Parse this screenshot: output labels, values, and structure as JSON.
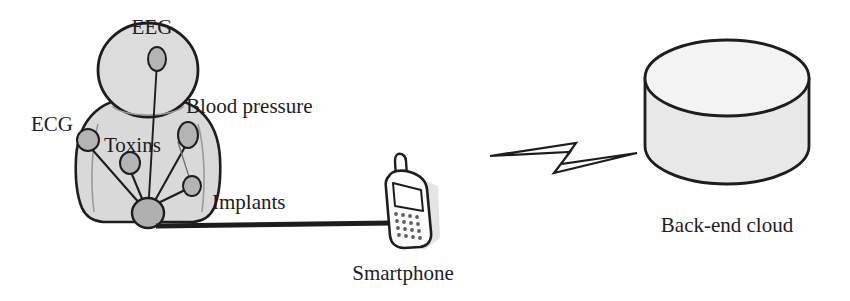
{
  "figure": {
    "background_color": "#ffffff",
    "ink_color": "#1d1d1d"
  },
  "colors": {
    "body_fill": "#d9d9d9",
    "head_fill": "#dcdcdc",
    "sensor_fill": "#b4b4b4",
    "hub_fill": "#b0b0b0",
    "cylinder_fill": "#f2f2f2",
    "cylinder_side_fill": "#e6e6e6",
    "phone_fill": "#fbfbfb",
    "phone_screen_fill": "#ffffff",
    "outline": "#1d1d1d",
    "shadow": "#e2e2e2",
    "link_line": "#2a2a2a"
  },
  "nodes": {
    "body": {
      "name": "human-body-silhouette",
      "label": "Body"
    },
    "sensors": [
      {
        "id": "eeg",
        "label": "EEG",
        "label_x": 152,
        "label_y": 34,
        "label_anchor": "middle",
        "font_size": 21,
        "cx": 157,
        "cy": 59,
        "rx": 9,
        "ry": 12
      },
      {
        "id": "ecg",
        "label": "ECG",
        "label_x": 31,
        "label_y": 131,
        "label_anchor": "start",
        "font_size": 21,
        "cx": 88,
        "cy": 140,
        "rx": 11,
        "ry": 11
      },
      {
        "id": "blood-pressure",
        "label": "Blood pressure",
        "label_x": 186,
        "label_y": 113,
        "label_anchor": "start",
        "font_size": 21,
        "cx": 188,
        "cy": 135,
        "rx": 10,
        "ry": 13
      },
      {
        "id": "toxins",
        "label": "Toxins",
        "label_x": 104,
        "label_y": 152,
        "label_anchor": "start",
        "font_size": 21,
        "cx": 130,
        "cy": 163,
        "rx": 10,
        "ry": 11
      },
      {
        "id": "implants",
        "label": "Implants",
        "label_x": 212,
        "label_y": 209,
        "label_anchor": "start",
        "font_size": 21,
        "cx": 192,
        "cy": 186,
        "rx": 9,
        "ry": 10
      }
    ],
    "hub": {
      "id": "hub",
      "name": "body-hub-node",
      "cx": 148,
      "cy": 213,
      "rx": 16,
      "ry": 15
    },
    "smartphone": {
      "id": "smartphone",
      "label": "Smartphone",
      "label_x": 403,
      "label_y": 280,
      "font_size": 21
    },
    "cloud": {
      "id": "back-end-cloud",
      "label": "Back-end cloud",
      "label_x": 727,
      "label_y": 232,
      "font_size": 21
    }
  },
  "links": {
    "body_to_phone": {
      "name": "wired-link-body-to-phone",
      "style": "thick-solid"
    },
    "phone_to_cloud": {
      "name": "wireless-link-lightning",
      "style": "lightning-bolt"
    },
    "sensor_links": [
      {
        "from": "eeg",
        "to": "hub"
      },
      {
        "from": "ecg",
        "to": "hub"
      },
      {
        "from": "toxins",
        "to": "hub"
      },
      {
        "from": "blood-pressure",
        "to": "hub"
      },
      {
        "from": "implants",
        "to": "hub"
      }
    ]
  }
}
